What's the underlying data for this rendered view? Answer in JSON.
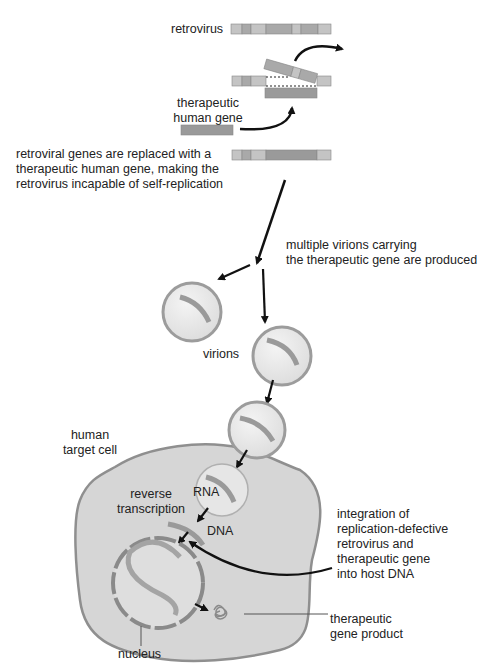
{
  "diagram": {
    "colors": {
      "light_segment": "#c4c4c4",
      "mid_segment": "#a9a9a9",
      "dark_segment": "#9a9a9a",
      "virion_fill": "#e9e9e9",
      "virion_border": "#9c9c9c",
      "cell_fill": "#d6d6d6",
      "cell_border": "#8f8f8f",
      "arrow": "#111111"
    },
    "labels": {
      "retrovirus": "retrovirus",
      "therapeutic_gene_line1": "therapeutic",
      "therapeutic_gene_line2": "human gene",
      "replaced_line1": "retroviral genes are replaced with a",
      "replaced_line2": "therapeutic human gene, making the",
      "replaced_line3": "retrovirus incapable of self-replication",
      "virions_produced_line1": "multiple virions carrying",
      "virions_produced_line2": "the therapeutic gene are produced",
      "virions": "virions",
      "target_cell_line1": "human",
      "target_cell_line2": "target cell",
      "reverse_line1": "reverse",
      "reverse_line2": "transcription",
      "rna": "RNA",
      "dna": "DNA",
      "integration_line1": "integration of",
      "integration_line2": "replication-defective",
      "integration_line3": "retrovirus and",
      "integration_line4": "therapeutic gene",
      "integration_line5": "into host DNA",
      "product_line1": "therapeutic",
      "product_line2": "gene product",
      "nucleus": "nucleus"
    }
  }
}
